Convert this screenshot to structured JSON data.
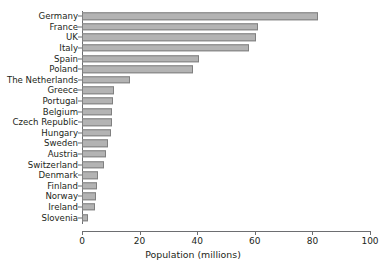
{
  "chart_data": {
    "type": "bar",
    "orientation": "horizontal",
    "title": "",
    "xlabel": "Population (millions)",
    "ylabel": "",
    "xlim": [
      0,
      100
    ],
    "xticks": [
      0,
      20,
      40,
      60,
      80,
      100
    ],
    "grid": false,
    "legend": null,
    "bar_color": "#b3b3b3",
    "bar_edge_color": "#808080",
    "axis_color": "#6d6e71",
    "text_color": "#231f20",
    "categories": [
      "Germany",
      "France",
      "UK",
      "Italy",
      "Spain",
      "Poland",
      "The Netherlands",
      "Greece",
      "Portugal",
      "Belgium",
      "Czech Republic",
      "Hungary",
      "Sweden",
      "Austria",
      "Switzerland",
      "Denmark",
      "Finland",
      "Norway",
      "Ireland",
      "Slovenia"
    ],
    "values": [
      82,
      61,
      60.5,
      58,
      40.5,
      38.5,
      16.5,
      11,
      10.8,
      10.5,
      10.3,
      10,
      9.2,
      8.3,
      7.6,
      5.5,
      5.3,
      4.8,
      4.4,
      2
    ]
  }
}
